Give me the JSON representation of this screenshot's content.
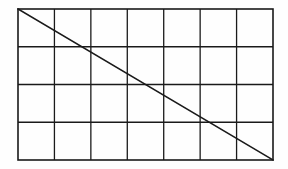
{
  "figure": {
    "background_color": "#fefefe",
    "line_color": "#1a1a1a",
    "border_color": "#1a1a1a",
    "diagonal_color": "#1a1a1a"
  },
  "chart_data": {
    "type": "diagram",
    "title": "",
    "xlabel": "",
    "ylabel": "",
    "grid": true,
    "columns": 7,
    "rows": 4,
    "cells_total": 28,
    "bounds": {
      "x0": 18,
      "y0": 9,
      "x1": 273,
      "y1": 160,
      "width": 255,
      "height": 151
    },
    "cell_size": {
      "width": 36.43,
      "height": 37.75
    },
    "vertical_gridlines_x": [
      18,
      54.43,
      90.86,
      127.29,
      163.71,
      200.14,
      236.57,
      273
    ],
    "horizontal_gridlines_y": [
      9,
      46.75,
      84.5,
      122.25,
      160
    ],
    "border_width": 1.6,
    "gridline_width": 1.3,
    "diagonal_width": 1.6,
    "shapes": [
      {
        "name": "outer-rectangle",
        "type": "rect",
        "x": 18,
        "y": 9,
        "width": 255,
        "height": 151,
        "stroke": "#1a1a1a",
        "fill": "none"
      },
      {
        "name": "diagonal-line",
        "type": "line",
        "x1": 18,
        "y1": 9,
        "x2": 273,
        "y2": 160,
        "stroke": "#1a1a1a",
        "from_corner": "top-left",
        "to_corner": "bottom-right"
      }
    ]
  }
}
